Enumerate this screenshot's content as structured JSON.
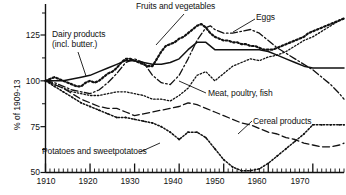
{
  "chart_data": {
    "type": "line",
    "title": "",
    "xlabel": "",
    "ylabel": "% of 1909-13",
    "xlim": [
      1910,
      1977
    ],
    "ylim": [
      50,
      137
    ],
    "grid": false,
    "legend_position": "inline-annotations",
    "yticks": [
      50,
      75,
      100,
      125
    ],
    "xticks": [
      1910,
      1920,
      1930,
      1940,
      1950,
      1960,
      1970
    ],
    "minor_tick_interval": 1,
    "series": [
      {
        "name": "Fruits and vegetables",
        "style": "dotted",
        "x": [
          1910,
          1911,
          1912,
          1913,
          1914,
          1915,
          1916,
          1917,
          1918,
          1919,
          1920,
          1921,
          1922,
          1923,
          1924,
          1925,
          1926,
          1927,
          1928,
          1929,
          1930,
          1931,
          1932,
          1933,
          1934,
          1935,
          1936,
          1937,
          1938,
          1939,
          1940,
          1941,
          1942,
          1943,
          1944,
          1945,
          1946,
          1947,
          1948,
          1949,
          1950,
          1951,
          1952,
          1953,
          1954,
          1955,
          1956,
          1957,
          1958,
          1959,
          1960,
          1961,
          1962,
          1963,
          1964,
          1965,
          1966,
          1967,
          1968,
          1969,
          1970,
          1971,
          1972,
          1973,
          1974,
          1975,
          1976,
          1977
        ],
        "y": [
          100,
          101,
          102,
          101,
          100,
          99,
          98,
          97,
          97,
          99,
          100,
          99,
          100,
          102,
          104,
          105,
          107,
          110,
          112,
          112,
          111,
          110,
          109,
          108,
          108,
          112,
          116,
          119,
          120,
          121,
          123,
          124,
          126,
          128,
          130,
          131,
          129,
          126,
          124,
          123,
          122,
          122,
          121,
          121,
          120,
          120,
          119,
          119,
          118,
          117,
          117,
          117,
          118,
          119,
          120,
          121,
          122,
          123,
          124,
          126,
          127,
          128,
          129,
          130,
          131,
          132,
          133,
          134
        ]
      },
      {
        "name": "Eggs",
        "style": "dash-dot",
        "x": [
          1910,
          1912,
          1914,
          1916,
          1918,
          1920,
          1922,
          1924,
          1926,
          1928,
          1930,
          1932,
          1934,
          1936,
          1938,
          1940,
          1942,
          1944,
          1946,
          1947,
          1948,
          1950,
          1952,
          1954,
          1956,
          1958,
          1960,
          1962,
          1964,
          1966,
          1968,
          1970,
          1972,
          1974,
          1976,
          1977
        ],
        "y": [
          100,
          99,
          97,
          95,
          94,
          93,
          95,
          99,
          104,
          110,
          112,
          110,
          103,
          99,
          98,
          103,
          112,
          122,
          129,
          130,
          128,
          126,
          126,
          127,
          128,
          126,
          122,
          118,
          115,
          112,
          109,
          106,
          102,
          98,
          93,
          90
        ]
      },
      {
        "name": "Dairy products (incl. butter.)",
        "style": "solid",
        "x": [
          1910,
          1912,
          1914,
          1916,
          1918,
          1920,
          1922,
          1924,
          1926,
          1928,
          1930,
          1932,
          1934,
          1936,
          1938,
          1940,
          1942,
          1944,
          1946,
          1948,
          1950,
          1952,
          1954,
          1956,
          1958,
          1960,
          1962,
          1964,
          1966,
          1968,
          1970,
          1972,
          1974,
          1976,
          1977
        ],
        "y": [
          100,
          100,
          100,
          101,
          102,
          103,
          105,
          107,
          109,
          111,
          111,
          110,
          109,
          109,
          110,
          112,
          117,
          121,
          121,
          117,
          117,
          117,
          117,
          117,
          117,
          116,
          114,
          112,
          110,
          108,
          107,
          107,
          107,
          107,
          107
        ]
      },
      {
        "name": "Meat, poultry, fish",
        "style": "fine-dotted",
        "x": [
          1910,
          1912,
          1914,
          1916,
          1918,
          1920,
          1922,
          1924,
          1926,
          1928,
          1930,
          1932,
          1934,
          1936,
          1938,
          1940,
          1942,
          1944,
          1946,
          1948,
          1950,
          1952,
          1954,
          1956,
          1958,
          1960,
          1962,
          1964,
          1966,
          1968,
          1970,
          1972,
          1974,
          1976,
          1977
        ],
        "y": [
          100,
          98,
          96,
          94,
          93,
          92,
          92,
          93,
          94,
          94,
          93,
          92,
          90,
          90,
          89,
          92,
          96,
          103,
          105,
          100,
          104,
          108,
          110,
          112,
          111,
          113,
          114,
          116,
          119,
          122,
          124,
          127,
          130,
          133,
          134
        ]
      },
      {
        "name": "Cereal products",
        "style": "long-dash",
        "x": [
          1910,
          1912,
          1914,
          1916,
          1918,
          1920,
          1922,
          1924,
          1926,
          1928,
          1930,
          1932,
          1934,
          1936,
          1938,
          1940,
          1942,
          1944,
          1946,
          1948,
          1950,
          1952,
          1954,
          1956,
          1958,
          1960,
          1962,
          1964,
          1966,
          1968,
          1970,
          1972,
          1974,
          1976,
          1977
        ],
        "y": [
          100,
          98,
          96,
          93,
          90,
          88,
          86,
          85,
          85,
          83,
          81,
          82,
          83,
          84,
          85,
          86,
          88,
          87,
          85,
          83,
          81,
          79,
          77,
          76,
          74,
          72,
          71,
          69,
          68,
          66,
          65,
          64,
          64,
          65,
          66
        ]
      },
      {
        "name": "Potatoes and sweetpotatoes",
        "style": "dotted-marker",
        "x": [
          1910,
          1912,
          1914,
          1916,
          1918,
          1920,
          1922,
          1924,
          1926,
          1928,
          1930,
          1932,
          1934,
          1936,
          1938,
          1940,
          1942,
          1944,
          1946,
          1948,
          1950,
          1952,
          1954,
          1956,
          1958,
          1960,
          1962,
          1964,
          1966,
          1968,
          1970,
          1972,
          1974,
          1976,
          1977
        ],
        "y": [
          100,
          97,
          94,
          91,
          88,
          86,
          84,
          82,
          80,
          80,
          79,
          78,
          77,
          75,
          72,
          68,
          72,
          72,
          69,
          63,
          57,
          53,
          51,
          51,
          52,
          55,
          59,
          63,
          67,
          71,
          76,
          76,
          76,
          76,
          76
        ]
      }
    ],
    "annotations": [
      {
        "name": "Fruits and vegetables",
        "text": "Fruits and vegetables"
      },
      {
        "name": "Eggs",
        "text": "Eggs"
      },
      {
        "name": "Dairy products",
        "text_line1": "Dairy products",
        "text_line2": "(incl. butter.)"
      },
      {
        "name": "Meat, poultry, fish",
        "text": "Meat, poultry, fish"
      },
      {
        "name": "Cereal products",
        "text": "Cereal products"
      },
      {
        "name": "Potatoes and sweetpotatoes",
        "text": "Potatoes and sweetpotatoes"
      }
    ]
  },
  "axis": {
    "y_title": "% of 1909-13",
    "y_labels": [
      "125",
      "100",
      "75",
      "50"
    ],
    "x_labels": [
      "1910",
      "1920",
      "1930",
      "1940",
      "1950",
      "1960",
      "1970"
    ]
  },
  "caption": {
    "text": ""
  },
  "colors": {
    "ink": "#111111",
    "background": "#ffffff"
  }
}
